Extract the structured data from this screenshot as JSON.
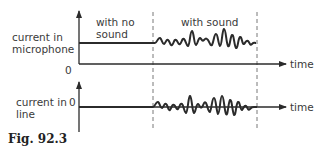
{
  "figure": {
    "caption": "Fig. 92.3",
    "top_graph": {
      "y_label_line1": "current in",
      "y_label_line2": "microphone",
      "origin_label": "0",
      "x_label": "time",
      "region_no_sound_line1": "with no",
      "region_no_sound_line2": "sound",
      "region_with_sound": "with sound"
    },
    "bottom_graph": {
      "y_label_line1": "current in",
      "y_label_line2": "line",
      "origin_label": "0",
      "x_label": "time"
    },
    "colors": {
      "line": "#2b2b2b",
      "text": "#3a3a3a",
      "dashed": "#555555"
    }
  }
}
